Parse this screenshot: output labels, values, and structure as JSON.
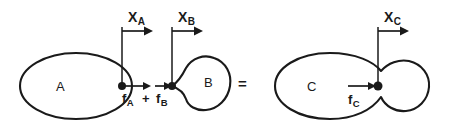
{
  "diagram": {
    "equals_symbol": "=",
    "plus_symbol": "+",
    "left_system": {
      "body_a": {
        "label": "A",
        "shape": "ellipse",
        "center": [
          76,
          86
        ],
        "radii": [
          56,
          33
        ]
      },
      "body_b": {
        "label": "B",
        "shape": "irregular-blob",
        "center": [
          199,
          82
        ]
      },
      "position_marker_a": {
        "label": "X",
        "subscript": "A",
        "leader_x": 122,
        "leader_top": 26,
        "leader_bottom": 86,
        "arrow_y": 31,
        "arrow_from": 122,
        "arrow_to": 152
      },
      "position_marker_b": {
        "label": "X",
        "subscript": "B",
        "leader_x": 172,
        "leader_top": 26,
        "leader_bottom": 86,
        "arrow_y": 31,
        "arrow_from": 172,
        "arrow_to": 202
      },
      "force_a": {
        "label": "f",
        "subscript": "A",
        "arrow_from": 124,
        "arrow_to": 150,
        "arrow_y": 86,
        "direction": "right"
      },
      "force_b": {
        "label": "f",
        "subscript": "B",
        "arrow_from": 156,
        "arrow_to": 172,
        "arrow_y": 86,
        "direction": "right"
      },
      "contact_point_a": [
        122,
        86
      ],
      "contact_point_b": [
        172,
        86
      ]
    },
    "right_system": {
      "body_c": {
        "label": "C",
        "shape": "merged-peanut",
        "center": [
          330,
          86
        ]
      },
      "position_marker_c": {
        "label": "X",
        "subscript": "C",
        "leader_x": 378,
        "leader_top": 26,
        "leader_bottom": 86,
        "arrow_y": 31,
        "arrow_from": 378,
        "arrow_to": 408
      },
      "force_c": {
        "label": "f",
        "subscript": "C",
        "arrow_from": 348,
        "arrow_to": 376,
        "arrow_y": 86,
        "direction": "right"
      },
      "contact_point_c": [
        378,
        86
      ]
    },
    "colors": {
      "ink": "#1a1a1a",
      "background": "#ffffff"
    }
  }
}
